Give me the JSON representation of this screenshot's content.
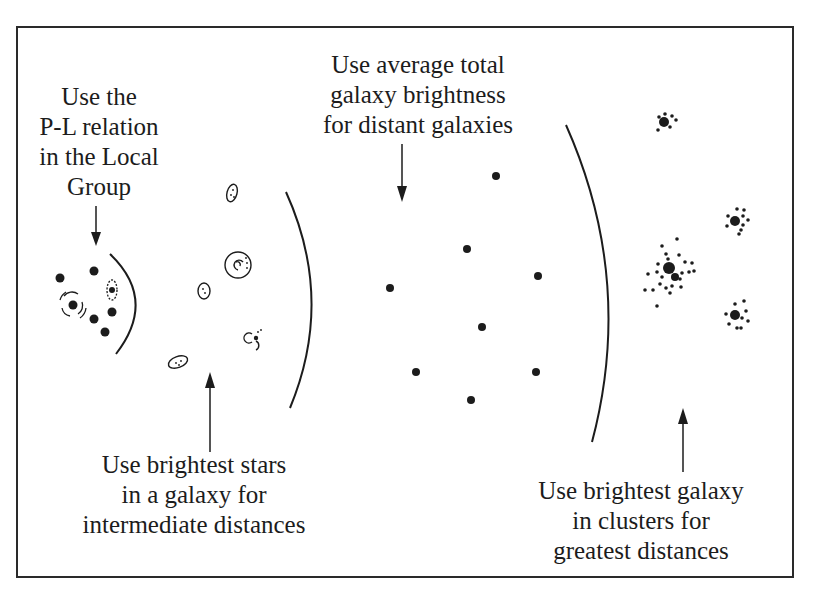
{
  "diagram": {
    "type": "distance-ladder-illustration",
    "colors": {
      "ink": "#1c1c1c",
      "background": "#ffffff",
      "frame": "#2a2a2a"
    },
    "labels": {
      "local_group": {
        "lines": [
          "Use the",
          "P-L relation",
          "in the Local",
          "Group"
        ]
      },
      "intermediate": {
        "lines": [
          "Use brightest stars",
          "in a galaxy for",
          "intermediate distances"
        ]
      },
      "distant": {
        "lines": [
          "Use average total",
          "galaxy brightness",
          "for distant galaxies"
        ]
      },
      "greatest": {
        "lines": [
          "Use brightest galaxy",
          "in clusters for",
          "greatest distances"
        ]
      }
    },
    "regions": [
      {
        "name": "local-group",
        "method": "P-L relation"
      },
      {
        "name": "intermediate",
        "method": "brightest stars"
      },
      {
        "name": "distant",
        "method": "average total galaxy brightness"
      },
      {
        "name": "greatest",
        "method": "brightest galaxy in clusters"
      }
    ]
  }
}
